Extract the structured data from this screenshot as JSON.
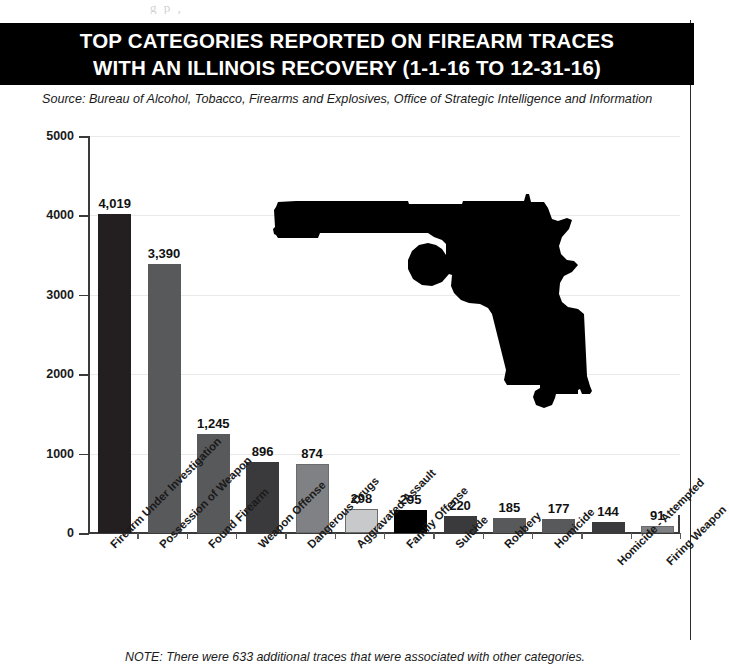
{
  "scan_artifact": "g   p  ,",
  "title": {
    "line1": "TOP CATEGORIES REPORTED ON FIREARM TRACES",
    "line2": "WITH AN ILLINOIS RECOVERY (1-1-16 TO 12-31-16)"
  },
  "source": "Source: Bureau of Alcohol, Tobacco, Firearms and Explosives, Office of Strategic Intelligence and Information",
  "footer_note": "NOTE: There were 633 additional traces that were associated with other categories.",
  "colors": {
    "banner_bg": "#000000",
    "banner_text": "#ffffff",
    "axis": "#3a3a3a",
    "grid": "#e9e9e9",
    "bar_darkest": "#231f20",
    "bar_black": "#000000",
    "bar_dark": "#3a3a3c",
    "bar_medium": "#58595b",
    "bar_mid": "#6d6e70",
    "bar_light_mid": "#808184",
    "bar_light": "#a7a9ac",
    "bar_lightest": "#c8c9ca"
  },
  "chart_data": {
    "type": "bar",
    "title": "TOP CATEGORIES REPORTED ON FIREARM TRACES WITH AN ILLINOIS RECOVERY (1-1-16 TO 12-31-16)",
    "xlabel": "",
    "ylabel": "",
    "ylim": [
      0,
      5000
    ],
    "yticks": [
      0,
      1000,
      2000,
      3000,
      4000,
      5000
    ],
    "ytick_labels": [
      "0",
      "1000",
      "2000",
      "3000",
      "4000",
      "5000"
    ],
    "grid": true,
    "legend": "none",
    "categories": [
      "Firearm Under Investigation",
      "Possession of Weapon",
      "Found Firearm",
      "Weapon Offense",
      "Dangerous Drugs",
      "Aggravated Assault",
      "Family Offense",
      "Suicide",
      "Robbery",
      "Homicide",
      "Homicide - Attempted",
      "Firing Weapon"
    ],
    "values": [
      4019,
      3390,
      1245,
      896,
      874,
      298,
      295,
      220,
      185,
      177,
      144,
      91
    ],
    "value_labels": [
      "4,019",
      "3,390",
      "1,245",
      "896",
      "874",
      "298",
      "295",
      "220",
      "185",
      "177",
      "144",
      "91"
    ],
    "bar_colors": [
      "#231f20",
      "#58595b",
      "#58595b",
      "#3a3a3c",
      "#808184",
      "#c8c9ca",
      "#000000",
      "#3a3a3c",
      "#58595b",
      "#58595b",
      "#3a3a3c",
      "#808184"
    ],
    "annotation": "NOTE: There were 633 additional traces that were associated with other categories."
  },
  "decoration": {
    "pistol_icon": "pistol-silhouette"
  }
}
